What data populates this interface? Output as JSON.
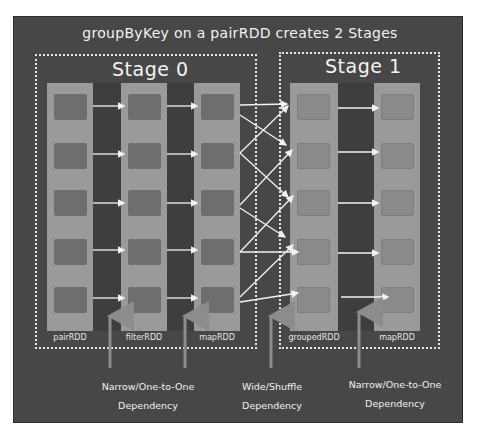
{
  "title": "groupByKey on a pairRDD creates 2 Stages",
  "stages": [
    {
      "label": "Stage 0"
    },
    {
      "label": "Stage 1"
    }
  ],
  "rdds": [
    {
      "name": "pairRDD",
      "stage": 0,
      "partitions": 5
    },
    {
      "name": "filterRDD",
      "stage": 0,
      "partitions": 5
    },
    {
      "name": "mapRDD",
      "stage": 0,
      "partitions": 5
    },
    {
      "name": "groupedRDD",
      "stage": 1,
      "partitions": 5
    },
    {
      "name": "mapRDD",
      "stage": 1,
      "partitions": 5
    }
  ],
  "dependencies": [
    {
      "line1": "Narrow/One-to-One",
      "line2": "Dependency"
    },
    {
      "line1": "Wide/Shuffle",
      "line2": "Dependency"
    },
    {
      "line1": "Narrow/One-to-One",
      "line2": "Dependency"
    }
  ],
  "colors": {
    "background": "#474747",
    "rdd_column": "#9a9a9a",
    "partition": "#6e6e6e",
    "arrow": "#f2f2f2",
    "dependency_pointer": "#8c8c8c"
  }
}
